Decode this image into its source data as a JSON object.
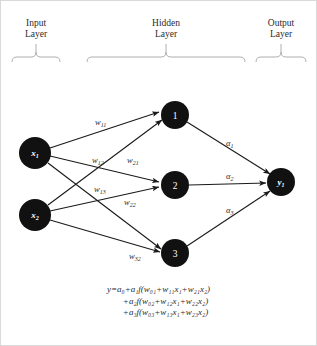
{
  "diagram": {
    "background": "#ffffff",
    "node_color": "#111111",
    "node_text_color": "#ffffff",
    "edge_color": "#1a1a1a"
  },
  "layers": {
    "input": {
      "title_line1": "Input",
      "title_line2": "Layer"
    },
    "hidden": {
      "title_line1": "Hidden",
      "title_line2": "Layer"
    },
    "output": {
      "title_line1": "Output",
      "title_line2": "Layer"
    }
  },
  "nodes": {
    "input": [
      {
        "id": "x1",
        "base": "x",
        "sub": "1",
        "cx": 35,
        "cy": 153,
        "r": 16
      },
      {
        "id": "x2",
        "base": "x",
        "sub": "2",
        "cx": 35,
        "cy": 215,
        "r": 16
      }
    ],
    "hidden": [
      {
        "id": "h1",
        "label": "1",
        "cx": 175,
        "cy": 115,
        "r": 14
      },
      {
        "id": "h2",
        "label": "2",
        "cx": 175,
        "cy": 185,
        "r": 14
      },
      {
        "id": "h3",
        "label": "3",
        "cx": 175,
        "cy": 253,
        "r": 14
      }
    ],
    "output": [
      {
        "id": "y1",
        "base": "y",
        "sub": "1",
        "cx": 281,
        "cy": 182,
        "r": 14
      }
    ]
  },
  "weights": [
    {
      "name": "w11",
      "base": "w",
      "sub": "11",
      "x": 95,
      "y": 125
    },
    {
      "name": "w12",
      "base": "w",
      "sub": "12",
      "x": 92,
      "y": 163
    },
    {
      "name": "w21",
      "base": "w",
      "sub": "21",
      "x": 127,
      "y": 163
    },
    {
      "name": "w13",
      "base": "w",
      "sub": "13",
      "x": 94,
      "y": 192
    },
    {
      "name": "w22",
      "base": "w",
      "sub": "22",
      "x": 124,
      "y": 205
    },
    {
      "name": "w32",
      "base": "w",
      "sub": "32",
      "x": 129,
      "y": 259
    }
  ],
  "alphas": [
    {
      "name": "a1",
      "base": "α",
      "sub": "1",
      "x": 226,
      "y": 146
    },
    {
      "name": "a2",
      "base": "α",
      "sub": "2",
      "x": 226,
      "y": 179
    },
    {
      "name": "a3",
      "base": "α",
      "sub": "3",
      "x": 226,
      "y": 213
    }
  ],
  "equation": {
    "line1": "y=a₀+a₁f(w₀₁+w₁₁x₁+w₂₁x₂)",
    "line2": "+a₂f(w₀₂+w₁₂x₁+w₂₂x₂)",
    "line3": "+a₃f(w₀₃+w₁₃x₁+w₂₃x₂)"
  }
}
